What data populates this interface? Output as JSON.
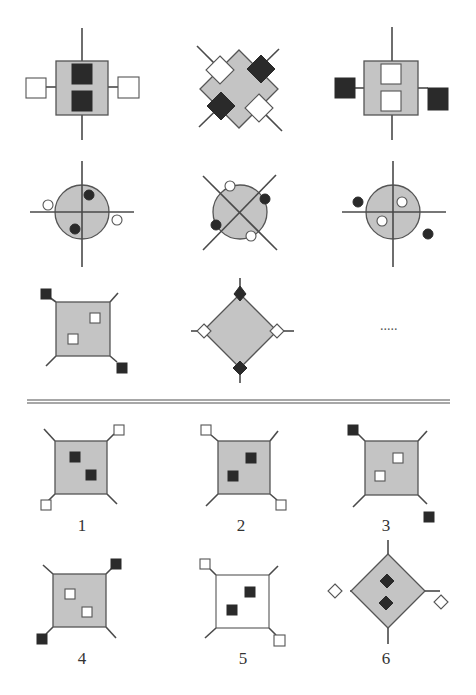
{
  "colors": {
    "gray_fill": "#c4c4c4",
    "stroke": "#555555",
    "dark": "#2a2a2a",
    "white": "#ffffff",
    "divider": "#8a8a8a"
  },
  "matrix": {
    "missing_placeholder": ".....",
    "cells": [
      {
        "id": "r1c1",
        "type": "square-with-vertical-line",
        "inner": [
          "black-square-top",
          "black-square-bottom"
        ],
        "outer": [
          "white-square-left",
          "white-square-right"
        ]
      },
      {
        "id": "r1c2",
        "type": "diamond-with-diagonals",
        "corner_squares": [
          "white-top-left",
          "black-top-right",
          "black-bottom-left",
          "white-bottom-right"
        ]
      },
      {
        "id": "r1c3",
        "type": "square-with-vertical-line",
        "inner": [
          "white-square-top",
          "white-square-bottom"
        ],
        "outer": [
          "black-square-left",
          "black-square-right"
        ]
      },
      {
        "id": "r2c1",
        "type": "circle-with-cross",
        "inner": [
          "black-dot-upper-right",
          "black-dot-lower-left"
        ],
        "outer": [
          "white-dot-left",
          "white-dot-right"
        ]
      },
      {
        "id": "r2c2",
        "type": "circle-with-x",
        "edge_dots": [
          "white-top",
          "black-right",
          "black-left",
          "white-bottom"
        ]
      },
      {
        "id": "r2c3",
        "type": "circle-with-cross",
        "inner": [
          "white-dot-upper-right",
          "white-dot-lower-left"
        ],
        "outer": [
          "black-dot-left",
          "black-dot-right"
        ]
      },
      {
        "id": "r3c1",
        "type": "square-with-corner-spokes",
        "inner": [
          "white-square",
          "white-square"
        ],
        "outer": [
          "black-top-left",
          "black-bottom-right"
        ]
      },
      {
        "id": "r3c2",
        "type": "diamond-with-spokes",
        "vertex_diamonds": [
          "black-top",
          "white-left",
          "white-right",
          "black-bottom"
        ]
      },
      {
        "id": "r3c3",
        "type": "missing"
      }
    ]
  },
  "options": [
    {
      "label": "1",
      "fill": "gray",
      "inner": "black",
      "inner_diag": "tl-br",
      "outer": "white",
      "outer_corners": [
        "top-right",
        "bottom-left"
      ]
    },
    {
      "label": "2",
      "fill": "gray",
      "inner": "black",
      "inner_diag": "tr-bl",
      "outer": "white",
      "outer_corners": [
        "top-left",
        "bottom-right"
      ]
    },
    {
      "label": "3",
      "fill": "gray",
      "inner": "white",
      "inner_diag": "tr-bl",
      "outer": "black",
      "outer_corners": [
        "top-left",
        "bottom-right-detached"
      ]
    },
    {
      "label": "4",
      "fill": "gray",
      "inner": "white",
      "inner_diag": "tl-br",
      "outer": "black",
      "outer_corners": [
        "top-right",
        "bottom-left"
      ]
    },
    {
      "label": "5",
      "fill": "white",
      "inner": "black",
      "inner_diag": "tr-bl",
      "outer": "white",
      "outer_corners": [
        "top-left",
        "bottom-right"
      ]
    },
    {
      "label": "6",
      "fill": "gray",
      "shape": "diamond",
      "inner": "black",
      "outer": "white",
      "outer_vertices": [
        "left",
        "right-detached"
      ]
    }
  ]
}
